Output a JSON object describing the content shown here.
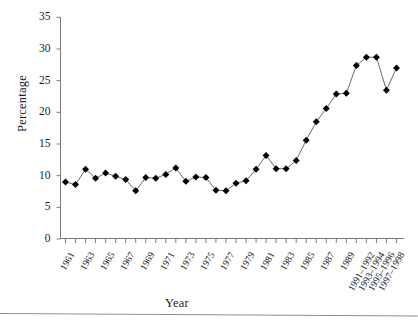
{
  "figure": {
    "axis_titles": {
      "y": "Percentage",
      "x": "Year"
    },
    "y_ticks": [
      "0",
      "5",
      "10",
      "15",
      "20",
      "25",
      "30",
      "35"
    ],
    "marker_style": "filled-diamond",
    "colors": {
      "marker": "#000000",
      "line": "#6b6b6b",
      "axis": "#7a7a7a",
      "text": "#1a1a1a"
    }
  },
  "chart_data": {
    "type": "line",
    "title": "",
    "xlabel": "Year",
    "ylabel": "Percentage",
    "ylim": [
      0,
      35
    ],
    "ytick_step": 5,
    "grid": false,
    "legend": "none",
    "marker": "filled-diamond",
    "categories": [
      "1961",
      "1962",
      "1963",
      "1964",
      "1965",
      "1966",
      "1967",
      "1968",
      "1969",
      "1970",
      "1971",
      "1972",
      "1973",
      "1974",
      "1975",
      "1976",
      "1977",
      "1978",
      "1979",
      "1980",
      "1981",
      "1982",
      "1983",
      "1984",
      "1985",
      "1986",
      "1987",
      "1988",
      "1989",
      "1990",
      "1991–1992",
      "1993–1994",
      "1995–1996",
      "1997–1998"
    ],
    "tick_labels_shown": [
      "1961",
      "1963",
      "1965",
      "1967",
      "1969",
      "1971",
      "1973",
      "1975",
      "1977",
      "1979",
      "1981",
      "1983",
      "1985",
      "1987",
      "1989",
      "1991–1992",
      "1993–1994",
      "1995–1996",
      "1997–1998"
    ],
    "values": [
      9.0,
      8.6,
      11.0,
      9.6,
      10.4,
      9.9,
      9.4,
      7.6,
      9.7,
      9.6,
      10.2,
      11.2,
      9.1,
      9.8,
      9.7,
      7.7,
      7.6,
      8.8,
      9.2,
      11.0,
      13.2,
      11.1,
      11.1,
      12.4,
      15.6,
      18.5,
      20.6,
      22.9,
      23.0,
      27.4,
      28.7,
      28.7,
      23.5,
      27.0
    ]
  }
}
